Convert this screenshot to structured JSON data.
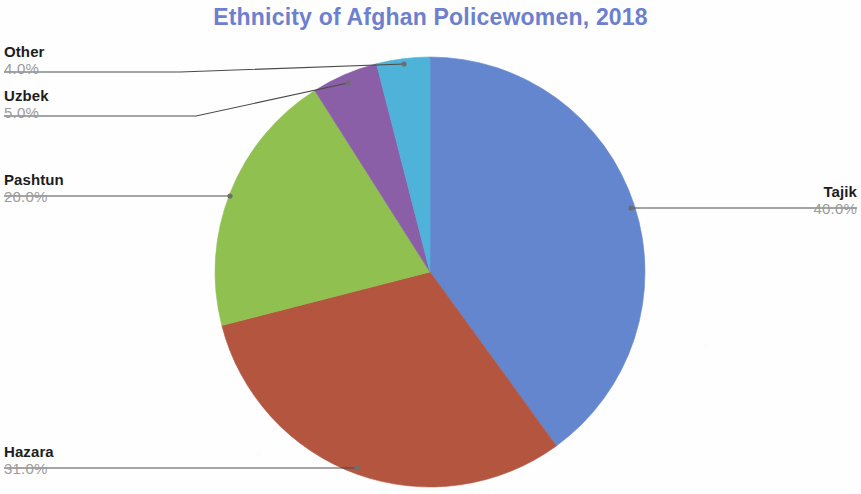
{
  "chart_data": {
    "type": "pie",
    "title": "Ethnicity of Afghan Policewomen, 2018",
    "title_color": "#6c80cf",
    "value_suffix": "%",
    "legend_position": "callout-labels",
    "start_angle_deg": 0,
    "direction": "clockwise",
    "categories": [
      "Tajik",
      "Hazara",
      "Pashtun",
      "Uzbek",
      "Other"
    ],
    "values": [
      40.0,
      31.0,
      20.0,
      5.0,
      4.0
    ],
    "value_labels": [
      "40.0%",
      "31.0%",
      "20.0%",
      "5.0%",
      "4.0%"
    ],
    "colors": [
      "#6486ce",
      "#b4553f",
      "#90c04f",
      "#8a5fa8",
      "#4fb2d8"
    ],
    "slices": [
      {
        "label": "Tajik",
        "value": 40.0,
        "value_label": "40.0%",
        "color": "#6486ce"
      },
      {
        "label": "Hazara",
        "value": 31.0,
        "value_label": "31.0%",
        "color": "#b4553f"
      },
      {
        "label": "Pashtun",
        "value": 20.0,
        "value_label": "20.0%",
        "color": "#90c04f"
      },
      {
        "label": "Uzbek",
        "value": 5.0,
        "value_label": "5.0%",
        "color": "#8a5fa8"
      },
      {
        "label": "Other",
        "value": 4.0,
        "value_label": "4.0%",
        "color": "#4fb2d8"
      }
    ],
    "total": 100.0
  },
  "header": {
    "title": "Ethnicity of Afghan Policewomen, 2018"
  },
  "labels": {
    "other": {
      "category": "Other",
      "percent": "4.0%"
    },
    "uzbek": {
      "category": "Uzbek",
      "percent": "5.0%"
    },
    "pashtun": {
      "category": "Pashtun",
      "percent": "20.0%"
    },
    "hazara": {
      "category": "Hazara",
      "percent": "31.0%"
    },
    "tajik": {
      "category": "Tajik",
      "percent": "40.0%"
    }
  }
}
